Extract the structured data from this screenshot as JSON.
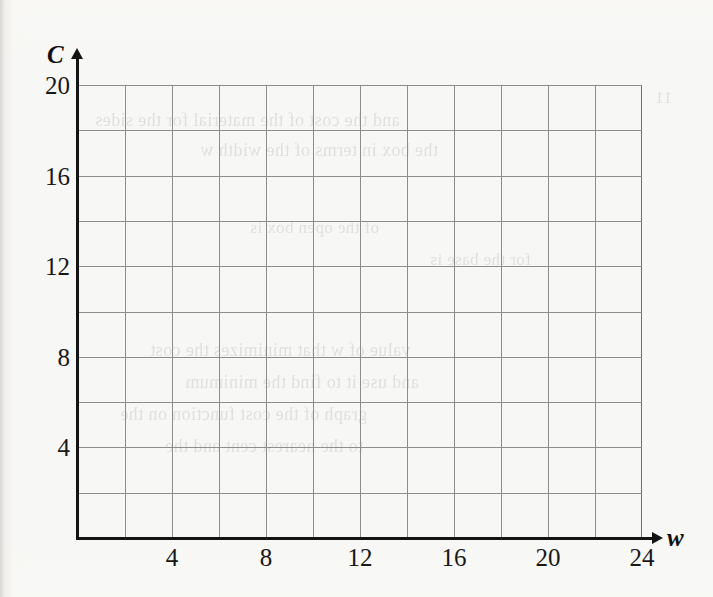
{
  "figure": {
    "kind": "blank-coordinate-grid",
    "page_background": "#f7f7f5",
    "axis_color": "#141414",
    "gridline_color": "#8d8d8d"
  },
  "axes": {
    "x": {
      "name": "w",
      "tick_labels": [
        "4",
        "8",
        "12",
        "16",
        "20",
        "24"
      ],
      "tick_values": [
        4,
        8,
        12,
        16,
        20,
        24
      ],
      "range": [
        0,
        24
      ],
      "minor_step": 2,
      "arrow": "right-arrow-icon"
    },
    "y": {
      "name": "C",
      "tick_labels": [
        "4",
        "8",
        "12",
        "16",
        "20"
      ],
      "tick_values": [
        4,
        8,
        12,
        16,
        20
      ],
      "range": [
        0,
        20
      ],
      "minor_step": 2,
      "arrow": "up-arrow-icon"
    }
  },
  "chart_data": {
    "type": "line",
    "title": "",
    "subtitle": "",
    "xlabel": "w",
    "ylabel": "C",
    "xlim": [
      0,
      24
    ],
    "ylim": [
      0,
      20
    ],
    "xticks": [
      4,
      8,
      12,
      16,
      20,
      24
    ],
    "yticks": [
      4,
      8,
      12,
      16,
      20
    ],
    "xtick_labels": [
      "4",
      "8",
      "12",
      "16",
      "20",
      "24"
    ],
    "ytick_labels": [
      "4",
      "8",
      "12",
      "16",
      "20"
    ],
    "x_minor_step": 2,
    "y_minor_step": 2,
    "grid": true,
    "legend": null,
    "annotations": [],
    "series": [],
    "note": "Empty grid — no data plotted; blank axes provided for the reader to draw on."
  },
  "background_bleed": {
    "description": "faint mirrored text bleeding through from the reverse side of the scanned page",
    "lines": [
      {
        "text": "and the cost of the material for the sides",
        "left": 95,
        "top": 110,
        "size": 18
      },
      {
        "text": "the box in terms of the width w",
        "left": 200,
        "top": 140,
        "size": 18
      },
      {
        "text": "value of w that minimizes the cost",
        "left": 150,
        "top": 340,
        "size": 18
      },
      {
        "text": "and use it to find the minimum",
        "left": 185,
        "top": 372,
        "size": 18
      },
      {
        "text": "graph of the cost function on the",
        "left": 120,
        "top": 404,
        "size": 18
      },
      {
        "text": "to the nearest cent and the",
        "left": 165,
        "top": 436,
        "size": 18
      },
      {
        "text": "of the open box is",
        "left": 250,
        "top": 218,
        "size": 17
      },
      {
        "text": "for the base is",
        "left": 430,
        "top": 250,
        "size": 17
      },
      {
        "text": "11",
        "left": 655,
        "top": 88,
        "size": 17
      }
    ]
  }
}
